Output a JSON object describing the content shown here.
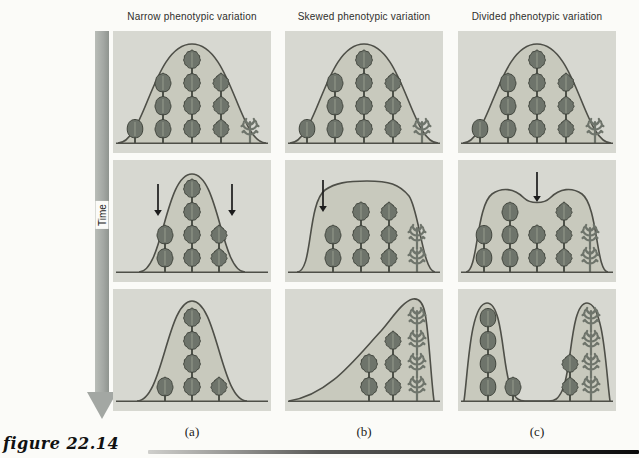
{
  "figure_label": "figure 22.14",
  "time_arrow": {
    "label": "Time"
  },
  "tree_types": {
    "1": "round-leaved-tree",
    "2": "shallow-lobed-tree",
    "3": "medium-lobed-tree",
    "4": "deep-lobed-tree",
    "5": "skeletal-narrow-leaf-tree"
  },
  "columns": [
    {
      "key": "a",
      "header": "Narrow phenotypic variation",
      "label": "(a)",
      "rows": [
        {
          "curve": "bell",
          "arrows": [],
          "trees": [
            {
              "x": 22,
              "type": 1,
              "n": 1
            },
            {
              "x": 50,
              "type": 2,
              "n": 3
            },
            {
              "x": 79,
              "type": 3,
              "n": 4
            },
            {
              "x": 108,
              "type": 4,
              "n": 3
            },
            {
              "x": 137,
              "type": 5,
              "n": 1
            }
          ]
        },
        {
          "curve": "narrow2",
          "arrows": [
            {
              "x": 45,
              "y1": 24,
              "y2": 56
            },
            {
              "x": 119,
              "y1": 24,
              "y2": 56
            }
          ],
          "trees": [
            {
              "x": 52,
              "type": 2,
              "n": 2
            },
            {
              "x": 79,
              "type": 3,
              "n": 4
            },
            {
              "x": 106,
              "type": 4,
              "n": 2
            }
          ]
        },
        {
          "curve": "narrow3",
          "arrows": [],
          "trees": [
            {
              "x": 52,
              "type": 2,
              "n": 1
            },
            {
              "x": 79,
              "type": 3,
              "n": 4
            },
            {
              "x": 106,
              "type": 4,
              "n": 1
            }
          ]
        }
      ]
    },
    {
      "key": "b",
      "header": "Skewed phenotypic variation",
      "label": "(b)",
      "rows": [
        {
          "curve": "bell",
          "arrows": [],
          "trees": [
            {
              "x": 22,
              "type": 1,
              "n": 1
            },
            {
              "x": 50,
              "type": 2,
              "n": 3
            },
            {
              "x": 79,
              "type": 3,
              "n": 4
            },
            {
              "x": 108,
              "type": 4,
              "n": 3
            },
            {
              "x": 137,
              "type": 5,
              "n": 1
            }
          ]
        },
        {
          "curve": "dome",
          "arrows": [
            {
              "x": 38,
              "y1": 20,
              "y2": 52
            }
          ],
          "trees": [
            {
              "x": 48,
              "type": 2,
              "n": 2
            },
            {
              "x": 76,
              "type": 3,
              "n": 3
            },
            {
              "x": 104,
              "type": 4,
              "n": 3
            },
            {
              "x": 132,
              "type": 5,
              "n": 2
            }
          ]
        },
        {
          "curve": "ramp",
          "arrows": [],
          "trees": [
            {
              "x": 84,
              "type": 3,
              "n": 2
            },
            {
              "x": 108,
              "type": 4,
              "n": 3
            },
            {
              "x": 132,
              "type": 5,
              "n": 4
            }
          ]
        }
      ]
    },
    {
      "key": "c",
      "header": "Divided phenotypic variation",
      "label": "(c)",
      "rows": [
        {
          "curve": "bell",
          "arrows": [],
          "trees": [
            {
              "x": 22,
              "type": 1,
              "n": 1
            },
            {
              "x": 50,
              "type": 2,
              "n": 3
            },
            {
              "x": 79,
              "type": 3,
              "n": 4
            },
            {
              "x": 108,
              "type": 4,
              "n": 3
            },
            {
              "x": 137,
              "type": 5,
              "n": 1
            }
          ]
        },
        {
          "curve": "bimodal",
          "arrows": [
            {
              "x": 79,
              "y1": 12,
              "y2": 42
            }
          ],
          "trees": [
            {
              "x": 26,
              "type": 1,
              "n": 2
            },
            {
              "x": 52,
              "type": 2,
              "n": 3
            },
            {
              "x": 79,
              "type": 3,
              "n": 2
            },
            {
              "x": 106,
              "type": 4,
              "n": 3
            },
            {
              "x": 132,
              "type": 5,
              "n": 2
            }
          ]
        },
        {
          "curve": "twohump",
          "arrows": [],
          "trees": [
            {
              "x": 30,
              "type": 1,
              "n": 4
            },
            {
              "x": 55,
              "type": 2,
              "n": 1
            },
            {
              "x": 112,
              "type": 4,
              "n": 2
            },
            {
              "x": 133,
              "type": 5,
              "n": 4
            }
          ]
        }
      ]
    }
  ],
  "colors": {
    "page_bg": "#fbfbf8",
    "panel_bg": "#d7d8d1",
    "curve_fill": "#c8c9bd",
    "curve_stroke": "#4e4f48",
    "tree_fill": "#6e746b",
    "tree_stroke": "#41453d",
    "tree_rib": "#9aa091",
    "arrow": "#1c1c1c",
    "time_bar": "#a3a7a3",
    "header_text": "#2e2e2c",
    "divider_to": "#0a0a0a"
  }
}
